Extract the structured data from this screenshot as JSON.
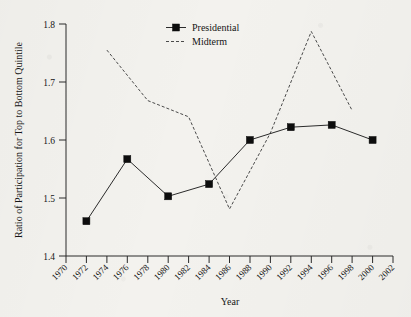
{
  "chart_data": {
    "type": "line",
    "title": "",
    "xlabel": "Year",
    "ylabel": "Ratio of Participation for Top to Bottom Quintile",
    "xlim": [
      1970,
      2002
    ],
    "ylim": [
      1.4,
      1.8
    ],
    "xticks": [
      1970,
      1972,
      1974,
      1976,
      1978,
      1980,
      1982,
      1984,
      1986,
      1988,
      1990,
      1992,
      1994,
      1996,
      1998,
      2000,
      2002
    ],
    "xtick_labels": [
      "1970",
      "1972",
      "1974",
      "1976",
      "1978",
      "1980",
      "1982",
      "1984",
      "1986",
      "1988",
      "1990",
      "1992",
      "1994",
      "1996",
      "1998",
      "2000",
      "2002"
    ],
    "yticks": [
      1.4,
      1.5,
      1.6,
      1.7,
      1.8
    ],
    "ytick_labels": [
      "1.4",
      "1.5",
      "1.6",
      "1.7",
      "1.8"
    ],
    "grid": false,
    "legend_position": "top-center",
    "series": [
      {
        "name": "Presidential",
        "style": "solid-line-with-square-markers",
        "marker": "filled-square",
        "color": "#0d0d0d",
        "x": [
          1972,
          1976,
          1980,
          1984,
          1988,
          1992,
          1996,
          2000
        ],
        "values": [
          1.46,
          1.567,
          1.503,
          1.524,
          1.6,
          1.622,
          1.626,
          1.6
        ]
      },
      {
        "name": "Midterm",
        "style": "dashed-line",
        "marker": "none",
        "color": "#4a4a4a",
        "x": [
          1974,
          1978,
          1982,
          1986,
          1990,
          1994,
          1998
        ],
        "values": [
          1.755,
          1.668,
          1.64,
          1.481,
          1.612,
          1.787,
          1.651
        ]
      }
    ]
  },
  "axes": {
    "ylabel": "Ratio of Participation for Top to Bottom Quintile",
    "xlabel": "Year"
  },
  "legend": {
    "entries": [
      {
        "label": "Presidential"
      },
      {
        "label": "Midterm"
      }
    ]
  }
}
